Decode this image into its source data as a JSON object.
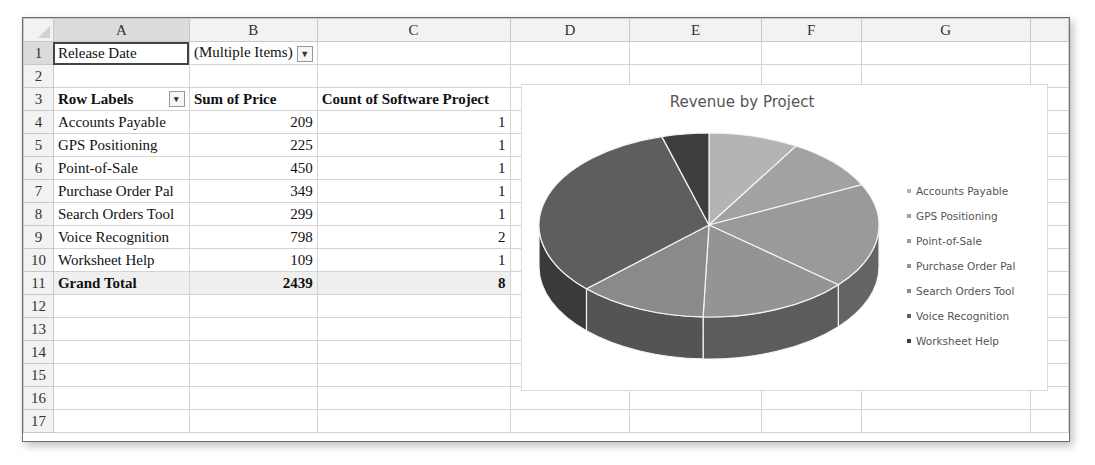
{
  "columns": [
    "A",
    "B",
    "C",
    "D",
    "E",
    "F",
    "G",
    ""
  ],
  "column_widths": [
    30,
    136,
    127,
    193,
    120,
    132,
    100,
    170,
    38
  ],
  "rows": [
    "1",
    "2",
    "3",
    "4",
    "5",
    "6",
    "7",
    "8",
    "9",
    "10",
    "11",
    "12",
    "13",
    "14",
    "15",
    "16",
    "17"
  ],
  "filter": {
    "label": "Release Date",
    "value": "(Multiple Items)",
    "icon": "filter-dropdown-icon"
  },
  "pivot": {
    "headers": {
      "row_labels": "Row Labels",
      "sum_price": "Sum of Price",
      "count_project": "Count of Software Project"
    },
    "rows": [
      {
        "label": "Accounts Payable",
        "price": "209",
        "count": "1"
      },
      {
        "label": "GPS Positioning",
        "price": "225",
        "count": "1"
      },
      {
        "label": "Point-of-Sale",
        "price": "450",
        "count": "1"
      },
      {
        "label": "Purchase Order Pal",
        "price": "349",
        "count": "1"
      },
      {
        "label": "Search Orders Tool",
        "price": "299",
        "count": "1"
      },
      {
        "label": "Voice Recognition",
        "price": "798",
        "count": "2"
      },
      {
        "label": "Worksheet Help",
        "price": "109",
        "count": "1"
      }
    ],
    "total": {
      "label": "Grand Total",
      "price": "2439",
      "count": "8"
    }
  },
  "chart": {
    "title": "Revenue by Project"
  },
  "chart_data": {
    "type": "pie",
    "title": "Revenue by Project",
    "categories": [
      "Accounts Payable",
      "GPS Positioning",
      "Point-of-Sale",
      "Purchase Order Pal",
      "Search Orders Tool",
      "Voice Recognition",
      "Worksheet Help"
    ],
    "values": [
      209,
      225,
      450,
      349,
      299,
      798,
      109
    ],
    "legend_position": "right",
    "style": "3d",
    "colors": [
      "#b4b4b4",
      "#a2a2a2",
      "#9a9a9a",
      "#949494",
      "#8a8a8a",
      "#5e5e5e",
      "#3e3e3e"
    ],
    "side_colors": [
      "#7a7a7a",
      "#6e6e6e",
      "#646464",
      "#5c5c5c",
      "#545454",
      "#3a3a3a",
      "#262626"
    ]
  }
}
